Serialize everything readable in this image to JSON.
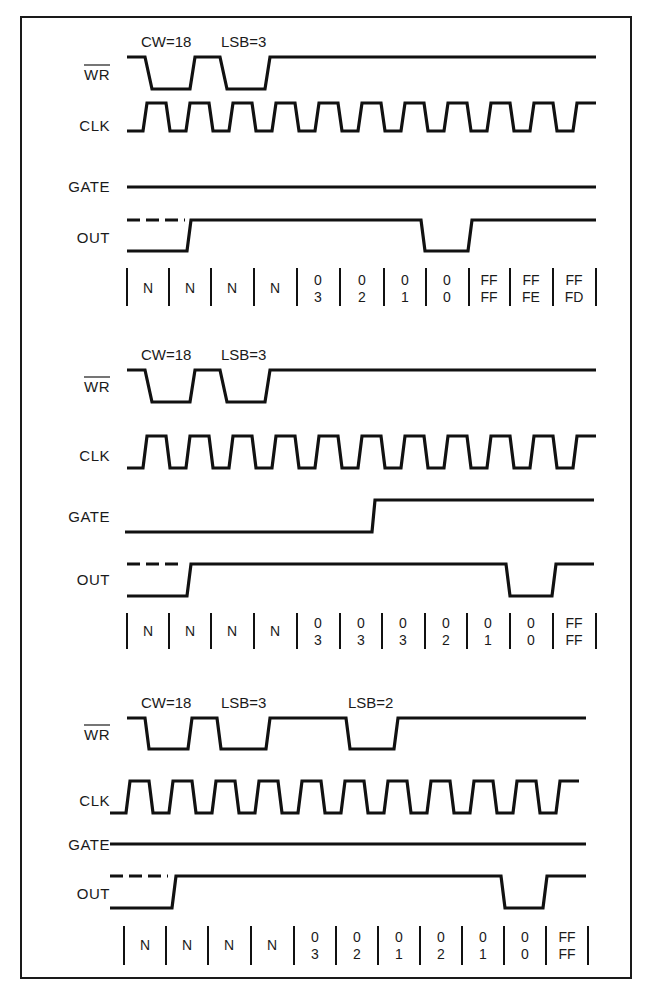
{
  "figure": {
    "type": "timing-diagram",
    "panels": [
      {
        "id": "panel-1",
        "annotations": [
          {
            "text": "CW=18",
            "x": 141
          },
          {
            "text": "LSB=3",
            "x": 221
          }
        ],
        "signals": {
          "wr": {
            "label": "WR",
            "overline": true
          },
          "clk": {
            "label": "CLK"
          },
          "gate": {
            "label": "GATE"
          },
          "out": {
            "label": "OUT"
          }
        },
        "counts": [
          {
            "top": "N",
            "bottom": ""
          },
          {
            "top": "N",
            "bottom": ""
          },
          {
            "top": "N",
            "bottom": ""
          },
          {
            "top": "N",
            "bottom": ""
          },
          {
            "top": "0",
            "bottom": "3"
          },
          {
            "top": "0",
            "bottom": "2"
          },
          {
            "top": "0",
            "bottom": "1"
          },
          {
            "top": "0",
            "bottom": "0"
          },
          {
            "top": "FF",
            "bottom": "FF"
          },
          {
            "top": "FF",
            "bottom": "FE"
          },
          {
            "top": "FF",
            "bottom": "FD"
          }
        ]
      },
      {
        "id": "panel-2",
        "annotations": [
          {
            "text": "CW=18",
            "x": 141
          },
          {
            "text": "LSB=3",
            "x": 221
          }
        ],
        "signals": {
          "wr": {
            "label": "WR",
            "overline": true
          },
          "clk": {
            "label": "CLK"
          },
          "gate": {
            "label": "GATE"
          },
          "out": {
            "label": "OUT"
          }
        },
        "counts": [
          {
            "top": "N",
            "bottom": ""
          },
          {
            "top": "N",
            "bottom": ""
          },
          {
            "top": "N",
            "bottom": ""
          },
          {
            "top": "N",
            "bottom": ""
          },
          {
            "top": "0",
            "bottom": "3"
          },
          {
            "top": "0",
            "bottom": "3"
          },
          {
            "top": "0",
            "bottom": "3"
          },
          {
            "top": "0",
            "bottom": "2"
          },
          {
            "top": "0",
            "bottom": "1"
          },
          {
            "top": "0",
            "bottom": "0"
          },
          {
            "top": "FF",
            "bottom": "FF"
          }
        ]
      },
      {
        "id": "panel-3",
        "annotations": [
          {
            "text": "CW=18",
            "x": 141
          },
          {
            "text": "LSB=3",
            "x": 221
          },
          {
            "text": "LSB=2",
            "x": 348
          }
        ],
        "signals": {
          "wr": {
            "label": "WR",
            "overline": true
          },
          "clk": {
            "label": "CLK"
          },
          "gate": {
            "label": "GATE"
          },
          "out": {
            "label": "OUT"
          }
        },
        "counts": [
          {
            "top": "N",
            "bottom": ""
          },
          {
            "top": "N",
            "bottom": ""
          },
          {
            "top": "N",
            "bottom": ""
          },
          {
            "top": "N",
            "bottom": ""
          },
          {
            "top": "0",
            "bottom": "3"
          },
          {
            "top": "0",
            "bottom": "2"
          },
          {
            "top": "0",
            "bottom": "1"
          },
          {
            "top": "0",
            "bottom": "2"
          },
          {
            "top": "0",
            "bottom": "1"
          },
          {
            "top": "0",
            "bottom": "0"
          },
          {
            "top": "FF",
            "bottom": "FF"
          }
        ]
      }
    ]
  }
}
